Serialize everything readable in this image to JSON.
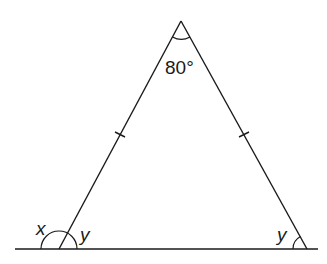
{
  "diagram": {
    "type": "isosceles-triangle-exterior-angle",
    "colors": {
      "stroke": "#1a1a1a",
      "background": "#ffffff"
    },
    "vertices": {
      "apex": {
        "x": 181,
        "y": 21
      },
      "left": {
        "x": 59,
        "y": 249
      },
      "right": {
        "x": 307,
        "y": 249
      }
    },
    "base_line": {
      "x1": 15,
      "x2": 318,
      "y": 249
    },
    "labels": {
      "apex_angle": "80°",
      "exterior_angle": "x",
      "left_interior_angle": "y",
      "right_interior_angle": "y"
    },
    "equal_sides": [
      "apex-left",
      "apex-right"
    ]
  }
}
